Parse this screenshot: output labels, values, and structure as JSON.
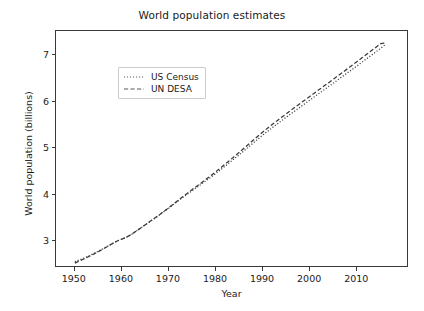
{
  "figure": {
    "background_color": "#ffffff",
    "axes_color": "#3a3a3a",
    "text_color": "#1a1a1a"
  },
  "chart_data": {
    "type": "line",
    "title": "World population estimates",
    "xlabel": "Year",
    "ylabel": "World population (billions)",
    "xlim": [
      1946,
      2021
    ],
    "ylim": [
      2.42,
      7.52
    ],
    "xticks": [
      1950,
      1960,
      1970,
      1980,
      1990,
      2000,
      2010
    ],
    "yticks": [
      3,
      4,
      5,
      6,
      7
    ],
    "grid": false,
    "legend_position": "upper left",
    "line_color": "#3a3a3a",
    "series": [
      {
        "name": "US Census",
        "linestyle": "dotted",
        "color": "#3a3a3a",
        "x": [
          1950,
          1951,
          1952,
          1953,
          1954,
          1955,
          1956,
          1957,
          1958,
          1959,
          1960,
          1961,
          1962,
          1963,
          1964,
          1965,
          1966,
          1967,
          1968,
          1969,
          1970,
          1971,
          1972,
          1973,
          1974,
          1975,
          1976,
          1977,
          1978,
          1979,
          1980,
          1981,
          1982,
          1983,
          1984,
          1985,
          1986,
          1987,
          1988,
          1989,
          1990,
          1991,
          1992,
          1993,
          1994,
          1995,
          1996,
          1997,
          1998,
          1999,
          2000,
          2001,
          2002,
          2003,
          2004,
          2005,
          2006,
          2007,
          2008,
          2009,
          2010,
          2011,
          2012,
          2013,
          2014,
          2015,
          2016
        ],
        "values": [
          2.557,
          2.595,
          2.636,
          2.682,
          2.73,
          2.781,
          2.835,
          2.891,
          2.948,
          3.001,
          3.043,
          3.084,
          3.14,
          3.21,
          3.28,
          3.35,
          3.421,
          3.491,
          3.563,
          3.638,
          3.712,
          3.79,
          3.867,
          3.942,
          4.016,
          4.089,
          4.16,
          4.233,
          4.306,
          4.38,
          4.458,
          4.537,
          4.618,
          4.7,
          4.782,
          4.863,
          4.947,
          5.032,
          5.118,
          5.203,
          5.285,
          5.365,
          5.443,
          5.519,
          5.595,
          5.67,
          5.745,
          5.818,
          5.892,
          5.965,
          6.038,
          6.111,
          6.184,
          6.257,
          6.33,
          6.403,
          6.477,
          6.551,
          6.625,
          6.699,
          6.773,
          6.848,
          6.923,
          6.998,
          7.073,
          7.148,
          7.23
        ]
      },
      {
        "name": "UN DESA",
        "linestyle": "dashed",
        "color": "#3a3a3a",
        "x": [
          1950,
          1951,
          1952,
          1953,
          1954,
          1955,
          1956,
          1957,
          1958,
          1959,
          1960,
          1961,
          1962,
          1963,
          1964,
          1965,
          1966,
          1967,
          1968,
          1969,
          1970,
          1971,
          1972,
          1973,
          1974,
          1975,
          1976,
          1977,
          1978,
          1979,
          1980,
          1981,
          1982,
          1983,
          1984,
          1985,
          1986,
          1987,
          1988,
          1989,
          1990,
          1991,
          1992,
          1993,
          1994,
          1995,
          1996,
          1997,
          1998,
          1999,
          2000,
          2001,
          2002,
          2003,
          2004,
          2005,
          2006,
          2007,
          2008,
          2009,
          2010,
          2011,
          2012,
          2013,
          2014,
          2015,
          2016
        ],
        "values": [
          2.525,
          2.572,
          2.619,
          2.668,
          2.719,
          2.773,
          2.828,
          2.886,
          2.945,
          3.001,
          3.043,
          3.084,
          3.141,
          3.211,
          3.282,
          3.353,
          3.424,
          3.495,
          3.568,
          3.644,
          3.722,
          3.802,
          3.881,
          3.959,
          4.036,
          4.112,
          4.187,
          4.262,
          4.338,
          4.415,
          4.495,
          4.577,
          4.661,
          4.745,
          4.83,
          4.915,
          5.002,
          5.09,
          5.179,
          5.266,
          5.351,
          5.433,
          5.513,
          5.591,
          5.668,
          5.744,
          5.82,
          5.895,
          5.97,
          6.044,
          6.118,
          6.192,
          6.266,
          6.34,
          6.414,
          6.488,
          6.563,
          6.638,
          6.713,
          6.789,
          6.866,
          6.942,
          7.019,
          7.096,
          7.173,
          7.25,
          7.26
        ]
      }
    ]
  },
  "legend": {
    "items": [
      {
        "label": "US Census",
        "style": "dotted"
      },
      {
        "label": "UN DESA",
        "style": "dashed"
      }
    ]
  }
}
